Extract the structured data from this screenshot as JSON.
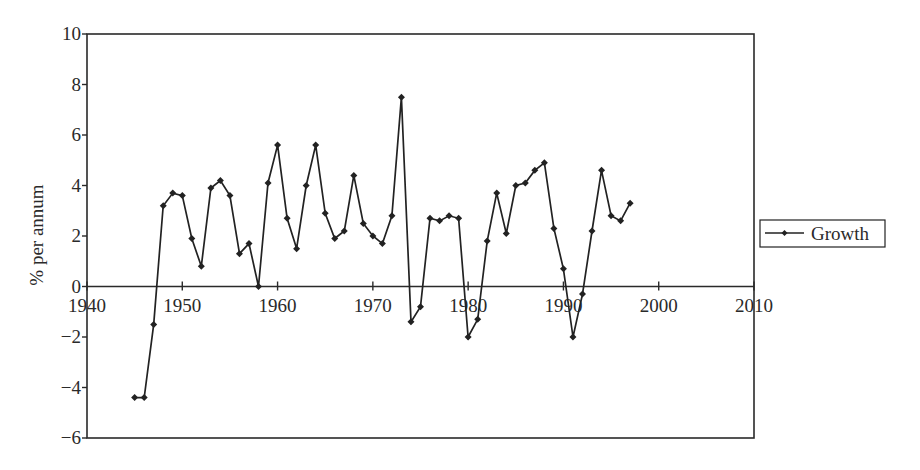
{
  "chart_data": {
    "type": "line",
    "title": "",
    "xlabel": "",
    "ylabel": "% per annum",
    "xlim": [
      1940,
      2010
    ],
    "ylim": [
      -6,
      10
    ],
    "x_ticks": [
      1940,
      1950,
      1960,
      1970,
      1980,
      1990,
      2000,
      2010
    ],
    "y_ticks": [
      10,
      8,
      6,
      4,
      2,
      0,
      -2,
      -4,
      -6
    ],
    "y_tick_labels": [
      "10",
      "8",
      "6",
      "4",
      "2",
      "0",
      "−2",
      "−4",
      "−6"
    ],
    "x_tick_labels": [
      "1940",
      "1950",
      "1960",
      "1970",
      "1980",
      "1990",
      "2000",
      "2010"
    ],
    "grid": false,
    "legend_position": "right",
    "series": [
      {
        "name": "Growth",
        "marker": "diamond",
        "color": "#222222",
        "x": [
          1945,
          1946,
          1947,
          1948,
          1949,
          1950,
          1951,
          1952,
          1953,
          1954,
          1955,
          1956,
          1957,
          1958,
          1959,
          1960,
          1961,
          1962,
          1963,
          1964,
          1965,
          1966,
          1967,
          1968,
          1969,
          1970,
          1971,
          1972,
          1973,
          1974,
          1975,
          1976,
          1977,
          1978,
          1979,
          1980,
          1981,
          1982,
          1983,
          1984,
          1985,
          1986,
          1987,
          1988,
          1989,
          1990,
          1991,
          1992,
          1993,
          1994,
          1995,
          1996,
          1997
        ],
        "values": [
          -4.4,
          -4.4,
          -1.5,
          3.2,
          3.7,
          3.6,
          1.9,
          0.8,
          3.9,
          4.2,
          3.6,
          1.3,
          1.7,
          0.0,
          4.1,
          5.6,
          2.7,
          1.5,
          4.0,
          5.6,
          2.9,
          1.9,
          2.2,
          4.4,
          2.5,
          2.0,
          1.7,
          2.8,
          7.5,
          -1.4,
          -0.8,
          2.7,
          2.6,
          2.8,
          2.7,
          -2.0,
          -1.3,
          1.8,
          3.7,
          2.1,
          4.0,
          4.1,
          4.6,
          4.9,
          2.3,
          0.7,
          -2.0,
          -0.3,
          2.2,
          4.6,
          2.8,
          2.6,
          3.3
        ]
      }
    ]
  },
  "legend": {
    "label": "Growth"
  }
}
